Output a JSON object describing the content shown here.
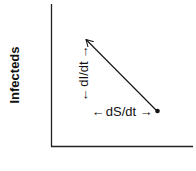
{
  "diagram": {
    "y_axis_label": "Infecteds",
    "x_axis_label": "",
    "vertical_label": "dI/dt",
    "horizontal_label": "dS/dt",
    "arrow_left": "←",
    "arrow_right": "→",
    "colors": {
      "ink": "#111111",
      "background": "#ffffff"
    }
  }
}
